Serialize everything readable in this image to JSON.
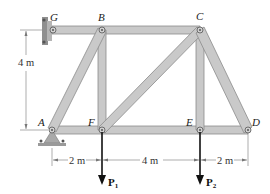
{
  "diagram": {
    "joints": {
      "G": "G",
      "B": "B",
      "C": "C",
      "A": "A",
      "F": "F",
      "E": "E",
      "D": "D"
    },
    "dimensions": {
      "height": "4 m",
      "AF": "2 m",
      "FE": "4 m",
      "ED": "2 m"
    },
    "loads": {
      "P1": "P",
      "P1_sub": "1",
      "P2": "P",
      "P2_sub": "2"
    },
    "colors": {
      "member_fill": "#c9c9c9",
      "member_edge": "#8a8a8a",
      "support": "#9a9a9a",
      "dimension_line": "#777777",
      "load_arrow": "#111111"
    }
  }
}
